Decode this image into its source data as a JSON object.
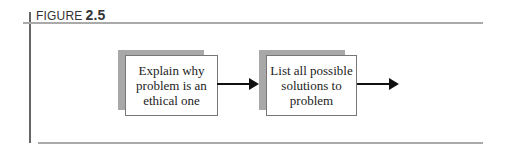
{
  "figure": {
    "label_word": "FIGURE",
    "label_number": "2.5"
  },
  "diagram": {
    "nodes": [
      {
        "id": "box1",
        "text": "Explain why problem is an ethical one"
      },
      {
        "id": "box2",
        "text": "List all possible solutions to problem"
      }
    ],
    "edges": [
      {
        "from": "box1",
        "to": "box2"
      },
      {
        "from": "box2",
        "to": "(continues)"
      }
    ]
  }
}
